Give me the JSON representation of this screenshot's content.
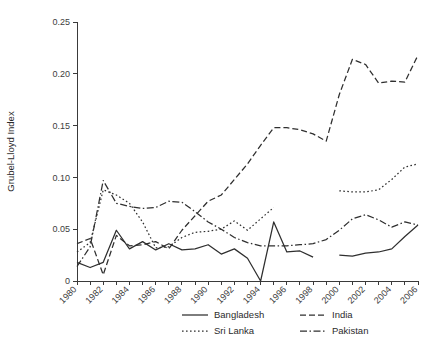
{
  "chart_data": {
    "type": "line",
    "title": "",
    "xlabel": "",
    "ylabel": "Grubel-Lloyd Index",
    "xlim": [
      1980,
      2006
    ],
    "ylim": [
      0,
      0.25
    ],
    "grid": false,
    "legend_position": "bottom",
    "y_ticks": [
      0,
      0.05,
      0.1,
      0.15,
      0.2,
      0.25
    ],
    "y_tick_labels": [
      "0",
      "0.05",
      "0.10",
      "0.15",
      "0.20",
      "0.25"
    ],
    "x_ticks": [
      1980,
      1981,
      1982,
      1983,
      1984,
      1985,
      1986,
      1987,
      1988,
      1989,
      1990,
      1991,
      1992,
      1993,
      1994,
      1995,
      1996,
      1997,
      1998,
      1999,
      2000,
      2001,
      2002,
      2003,
      2004,
      2005,
      2006
    ],
    "x_tick_labels": [
      "1980",
      "1982",
      "1984",
      "1986",
      "1988",
      "1990",
      "1992",
      "1994",
      "1996",
      "1998",
      "2000",
      "2002",
      "2004",
      "2006"
    ],
    "x_labeled_ticks": [
      1980,
      1982,
      1984,
      1986,
      1988,
      1990,
      1992,
      1994,
      1996,
      1998,
      2000,
      2002,
      2004,
      2006
    ],
    "series": [
      {
        "name": "Bangladesh",
        "style": "solid",
        "dash": "",
        "x": [
          1980,
          1981,
          1982,
          1983,
          1984,
          1985,
          1986,
          1987,
          1988,
          1989,
          1990,
          1991,
          1992,
          1993,
          1994,
          1995,
          1996,
          1997,
          1998,
          2000,
          2001,
          2002,
          2003,
          2004,
          2005,
          2006
        ],
        "values": [
          0.018,
          0.013,
          0.018,
          0.049,
          0.031,
          0.038,
          0.03,
          0.036,
          0.03,
          0.031,
          0.035,
          0.026,
          0.031,
          0.022,
          0.0,
          0.057,
          0.028,
          0.029,
          0.023,
          0.025,
          0.024,
          0.027,
          0.028,
          0.031,
          0.043,
          0.054
        ]
      },
      {
        "name": "India",
        "style": "dashed",
        "dash": "6,3",
        "x": [
          1980,
          1981,
          1982,
          1983,
          1984,
          1985,
          1986,
          1987,
          1988,
          1989,
          1990,
          1991,
          1992,
          1993,
          1994,
          1995,
          1996,
          1997,
          1998,
          1999,
          2000,
          2001,
          2002,
          2003,
          2004,
          2005,
          2006
        ],
        "values": [
          0.036,
          0.041,
          0.006,
          0.044,
          0.034,
          0.035,
          0.038,
          0.031,
          0.049,
          0.063,
          0.077,
          0.083,
          0.098,
          0.113,
          0.131,
          0.148,
          0.148,
          0.146,
          0.142,
          0.135,
          0.18,
          0.214,
          0.209,
          0.191,
          0.193,
          0.192,
          0.218
        ]
      },
      {
        "name": "Sri Lanka",
        "style": "dotted",
        "dash": "1.6,2.4",
        "x": [
          1980,
          1981,
          1982,
          1983,
          1984,
          1985,
          1986,
          1987,
          1988,
          1989,
          1990,
          1991,
          1992,
          1993,
          1994,
          1995,
          2000,
          2001,
          2002,
          2003,
          2004,
          2005,
          2006
        ],
        "values": [
          0.028,
          0.037,
          0.088,
          0.083,
          0.075,
          0.057,
          0.032,
          0.033,
          0.042,
          0.047,
          0.048,
          0.05,
          0.058,
          0.049,
          0.06,
          0.071,
          0.087,
          0.086,
          0.086,
          0.088,
          0.098,
          0.11,
          0.113
        ]
      },
      {
        "name": "Pakistan",
        "style": "dashdot",
        "dash": "7,2.5,1.5,2.5",
        "x": [
          1980,
          1981,
          1982,
          1983,
          1984,
          1985,
          1986,
          1987,
          1988,
          1989,
          1990,
          1991,
          1992,
          1993,
          1994,
          1995,
          1996,
          1997,
          1998,
          1999,
          2000,
          2001,
          2002,
          2003,
          2004,
          2005,
          2006
        ],
        "values": [
          0.014,
          0.033,
          0.097,
          0.075,
          0.072,
          0.07,
          0.071,
          0.077,
          0.076,
          0.067,
          0.057,
          0.05,
          0.042,
          0.037,
          0.034,
          0.034,
          0.034,
          0.035,
          0.036,
          0.04,
          0.049,
          0.06,
          0.064,
          0.059,
          0.052,
          0.057,
          0.054
        ]
      }
    ]
  },
  "legend": {
    "items": [
      {
        "label": "Bangladesh",
        "style": "solid"
      },
      {
        "label": "India",
        "style": "dashed"
      },
      {
        "label": "Sri Lanka",
        "style": "dotted"
      },
      {
        "label": "Pakistan",
        "style": "dashdot"
      }
    ]
  },
  "colors": {
    "line": "#2f2f2f",
    "axis": "#3a3a3a",
    "text": "#2b2b2b",
    "background": "#ffffff"
  }
}
